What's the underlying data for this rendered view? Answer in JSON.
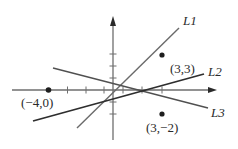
{
  "diagram": {
    "type": "coordinate-plane-lines",
    "axes": {
      "origin_px": [
        113,
        90
      ],
      "x_unit_px": 16.3,
      "y_unit_px": 12,
      "x_ticks": [
        -4,
        -3,
        -2,
        -1,
        1,
        2,
        3
      ],
      "y_ticks": [
        -2,
        -1,
        1,
        2,
        3
      ],
      "color": "#6e6e6e"
    },
    "points": [
      {
        "label": "(−4,0)",
        "x": -4,
        "y": 0
      },
      {
        "label": "(3,3)",
        "x": 3,
        "y": 3
      },
      {
        "label": "(3,−2)",
        "x": 3,
        "y": -2
      }
    ],
    "lines": [
      {
        "label": "L1",
        "from_px": [
          77,
          128
        ],
        "to_px": [
          179,
          28
        ],
        "color": "#6a6a6a"
      },
      {
        "label": "L2",
        "from_px": [
          33,
          121
        ],
        "to_px": [
          204,
          74
        ],
        "color": "#2e2e2e"
      },
      {
        "label": "L3",
        "from_px": [
          53,
          68
        ],
        "to_px": [
          208,
          108
        ],
        "color": "#505050"
      }
    ]
  }
}
